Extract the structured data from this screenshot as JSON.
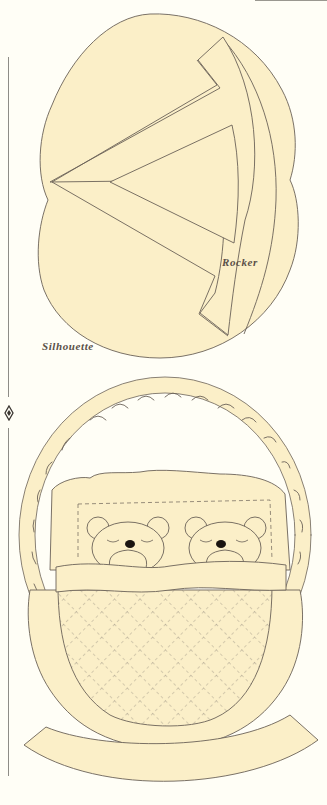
{
  "page": {
    "labels": {
      "rocker": "Rocker",
      "silhouette": "Silhouette"
    },
    "colors": {
      "background": "#fffef6",
      "fill": "#fbefc8",
      "outline": "#6b6258",
      "rule": "#8e8c86",
      "eyes": "#1a1410"
    },
    "ornament": "diamond-ornament"
  }
}
